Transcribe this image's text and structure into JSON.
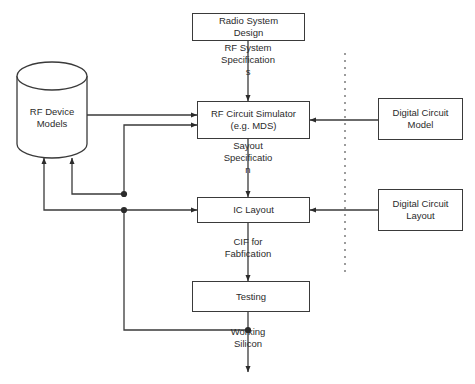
{
  "diagram": {
    "stroke_color": "#3a3a3a",
    "text_color": "#2b2b2b",
    "background": "#ffffff",
    "nodes": {
      "radio_system_design": {
        "line1": "Radio System",
        "line2": "Design"
      },
      "rf_circuit_simulator": {
        "line1": "RF Circuit Simulator",
        "line2": "(e.g. MDS)"
      },
      "ic_layout": {
        "line1": "IC Layout"
      },
      "testing": {
        "line1": "Testing"
      },
      "digital_circuit_model": {
        "line1": "Digital Circuit",
        "line2": "Model"
      },
      "digital_circuit_layout": {
        "line1": "Digital Circuit",
        "line2": "Layout"
      },
      "rf_device_models": {
        "line1": "RF Device",
        "line2": "Models"
      }
    },
    "edge_labels": {
      "rf_system_spec": "RF  System\nSpecification\ns",
      "layout_spec": "Sayout\nSpecificatio\nn",
      "cif_fabrication": "CIF for\nFabfication",
      "working_silicon": "Working\nSilicon"
    },
    "divider": {
      "name": "analog-digital-divider",
      "style": "dashed-vertical"
    }
  }
}
